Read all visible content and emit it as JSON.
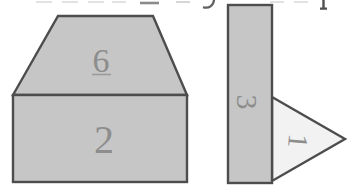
{
  "canvas": {
    "background": "#ffffff"
  },
  "colors": {
    "shape_fill": "#c6c6c6",
    "triangle_fill": "#f2f2f2",
    "outline": "#4d4d4d",
    "label_text": "#8d8d8d",
    "underline": "#9a9a9a",
    "fragment_dark": "#5f5f5f",
    "fragment_faint": "#e2e2e2"
  },
  "top_cropped_line": {
    "fragments": [
      "letter-bottom-dashes",
      "y-descender",
      "stem-with-bottom-serif"
    ]
  },
  "figures": {
    "left": {
      "trapezoid_label": "6",
      "trapezoid_label_underlined": true,
      "rectangle_label": "2"
    },
    "right": {
      "rectangle_label": "3",
      "rectangle_label_rotation_deg": 90,
      "triangle_label": "1",
      "triangle_label_rotation_deg": 90
    }
  }
}
